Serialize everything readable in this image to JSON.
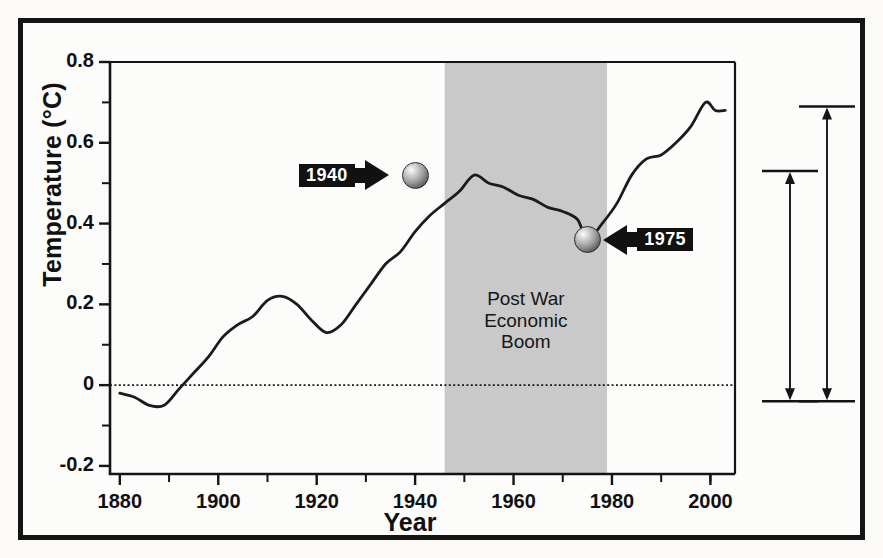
{
  "chart_data": {
    "type": "line",
    "title": "",
    "xlabel": "Year",
    "ylabel": "Temperature (°C)",
    "xlim": [
      1878,
      2005
    ],
    "ylim": [
      -0.22,
      0.8
    ],
    "grid": false,
    "legend": "none",
    "xticks": [
      1880,
      1900,
      1920,
      1940,
      1960,
      1980,
      2000
    ],
    "xtick_labels": [
      "1880",
      "1900",
      "1920",
      "1940",
      "1960",
      "1980",
      "2000"
    ],
    "xminor_ticks": [
      1890,
      1910,
      1930,
      1950,
      1970,
      1990,
      2000
    ],
    "yticks": [
      -0.2,
      0,
      0.2,
      0.4,
      0.6,
      0.8
    ],
    "ytick_labels": [
      "-0.2",
      "0",
      "0.2",
      "0.4",
      "0.6",
      "0.8"
    ],
    "yminor_ticks": [
      -0.1,
      0.1,
      0.3,
      0.5,
      0.7
    ],
    "zero_line": {
      "value": 0,
      "style": "dotted"
    },
    "series": [
      {
        "name": "Global mean temperature anomaly",
        "x": [
          1880,
          1883,
          1886,
          1889,
          1892,
          1895,
          1898,
          1901,
          1904,
          1907,
          1910,
          1913,
          1916,
          1919,
          1922,
          1925,
          1928,
          1931,
          1934,
          1937,
          1940,
          1943,
          1946,
          1949,
          1952,
          1955,
          1958,
          1961,
          1964,
          1967,
          1970,
          1973,
          1975,
          1978,
          1981,
          1984,
          1987,
          1990,
          1993,
          1996,
          1999,
          2001,
          2003
        ],
        "y": [
          -0.02,
          -0.03,
          -0.05,
          -0.05,
          -0.01,
          0.03,
          0.07,
          0.12,
          0.15,
          0.17,
          0.21,
          0.22,
          0.2,
          0.16,
          0.13,
          0.15,
          0.2,
          0.25,
          0.3,
          0.33,
          0.38,
          0.42,
          0.45,
          0.48,
          0.52,
          0.5,
          0.49,
          0.47,
          0.46,
          0.44,
          0.43,
          0.41,
          0.36,
          0.4,
          0.45,
          0.52,
          0.56,
          0.57,
          0.6,
          0.64,
          0.7,
          0.68,
          0.68
        ]
      }
    ],
    "shaded_region": {
      "label_lines": [
        "Post War",
        "Economic",
        "Boom"
      ],
      "x_start": 1946,
      "x_end": 1979,
      "color": "#c9c9c9"
    },
    "annotations": [
      {
        "name": "1940-callout",
        "label": "1940",
        "direction": "right",
        "point_x": 1940,
        "point_y": 0.52
      },
      {
        "name": "1975-callout",
        "label": "1975",
        "direction": "left",
        "point_x": 1975,
        "point_y": 0.36
      }
    ],
    "range_bars": [
      {
        "name": "inner-range-bar",
        "top_value": 0.53,
        "bottom_value": -0.04
      },
      {
        "name": "outer-range-bar",
        "top_value": 0.69,
        "bottom_value": -0.04
      }
    ]
  }
}
